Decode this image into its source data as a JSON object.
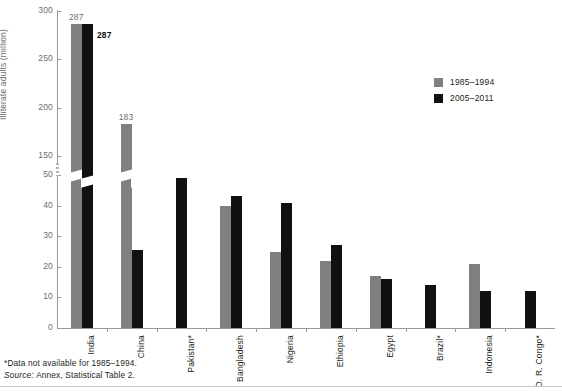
{
  "chart_data": {
    "type": "bar",
    "title": "",
    "xlabel": "",
    "ylabel": "Illiterate adults (million)",
    "grid": false,
    "legend_position": "top-right",
    "axis_break": {
      "from": 50,
      "to": 150,
      "note": "y-axis has a broken scale between 50 and 150"
    },
    "yticks": [
      0,
      10,
      20,
      30,
      40,
      50,
      150,
      200,
      250,
      300
    ],
    "ylim_lower": [
      0,
      50
    ],
    "ylim_upper": [
      150,
      300
    ],
    "categories": [
      "India",
      "China",
      "Pakistan*",
      "Bangladesh",
      "Nigeria",
      "Ethiopia",
      "Egypt",
      "Brazil*",
      "Indonesia",
      "D. R. Congo*"
    ],
    "series": [
      {
        "name": "1985–1994",
        "color": "#808080",
        "values": [
          287,
          183,
          null,
          40,
          25,
          22,
          17,
          null,
          21,
          null
        ]
      },
      {
        "name": "2005–2011",
        "color": "#111111",
        "values": [
          287,
          53,
          49,
          43,
          41,
          27,
          16,
          14,
          12,
          12
        ]
      }
    ],
    "data_labels": [
      {
        "category": "India",
        "series": "1985–1994",
        "value": 287,
        "text": "287"
      },
      {
        "category": "India",
        "series": "2005–2011",
        "value": 287,
        "text": "287"
      },
      {
        "category": "China",
        "series": "1985–1994",
        "value": 183,
        "text": "183"
      }
    ]
  },
  "legend": {
    "items": [
      {
        "label": "1985–1994",
        "color": "#808080"
      },
      {
        "label": "2005–2011",
        "color": "#111111"
      }
    ]
  },
  "footer": {
    "note": "*Data not available for 1985–1994.",
    "source_prefix": "Source:",
    "source_text": "Annex, Statistical Table 2."
  }
}
